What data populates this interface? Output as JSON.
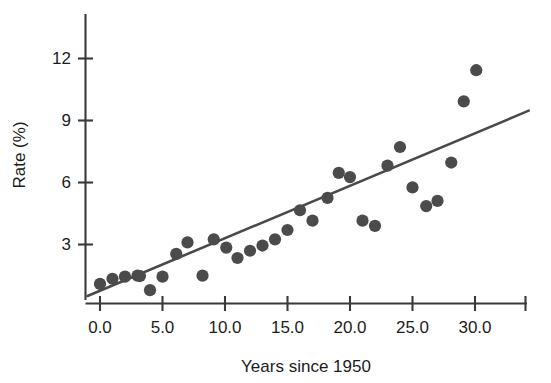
{
  "chart_data": {
    "type": "scatter",
    "title": "",
    "subtitle": "",
    "xlabel": "Years since 1950",
    "ylabel": "Rate (%)",
    "xlim": [
      -1.0,
      34.0
    ],
    "ylim": [
      0.3,
      13.2
    ],
    "xticks": [
      0.0,
      5.0,
      10.0,
      15.0,
      20.0,
      25.0,
      30.0
    ],
    "xtick_labels": [
      "0.0",
      "5.0",
      "10.0",
      "15.0",
      "20.0",
      "25.0",
      "30.0"
    ],
    "yticks": [
      3,
      6,
      9,
      12
    ],
    "ytick_labels": [
      "3",
      "6",
      "9",
      "12"
    ],
    "grid": false,
    "legend": null,
    "marker_color": "#4b4b4b",
    "line_color": "#4a4a4a",
    "axis_color": "#3a3a3a",
    "points": [
      {
        "x": 0.0,
        "y": 1.1
      },
      {
        "x": 1.0,
        "y": 1.35
      },
      {
        "x": 2.0,
        "y": 1.45
      },
      {
        "x": 3.0,
        "y": 1.5
      },
      {
        "x": 3.2,
        "y": 1.48
      },
      {
        "x": 4.0,
        "y": 0.8
      },
      {
        "x": 5.0,
        "y": 1.45
      },
      {
        "x": 6.1,
        "y": 2.55
      },
      {
        "x": 7.0,
        "y": 3.1
      },
      {
        "x": 8.2,
        "y": 1.5
      },
      {
        "x": 9.1,
        "y": 3.25
      },
      {
        "x": 10.1,
        "y": 2.85
      },
      {
        "x": 11.0,
        "y": 2.35
      },
      {
        "x": 12.0,
        "y": 2.7
      },
      {
        "x": 13.0,
        "y": 2.95
      },
      {
        "x": 14.0,
        "y": 3.25
      },
      {
        "x": 15.0,
        "y": 3.7
      },
      {
        "x": 16.0,
        "y": 4.65
      },
      {
        "x": 17.0,
        "y": 4.15
      },
      {
        "x": 18.2,
        "y": 5.25
      },
      {
        "x": 19.1,
        "y": 6.45
      },
      {
        "x": 20.0,
        "y": 6.25
      },
      {
        "x": 21.0,
        "y": 4.15
      },
      {
        "x": 22.0,
        "y": 3.9
      },
      {
        "x": 23.0,
        "y": 6.8
      },
      {
        "x": 24.0,
        "y": 7.7
      },
      {
        "x": 25.0,
        "y": 5.75
      },
      {
        "x": 26.1,
        "y": 4.85
      },
      {
        "x": 27.0,
        "y": 5.1
      },
      {
        "x": 28.1,
        "y": 6.95
      },
      {
        "x": 29.1,
        "y": 9.9
      },
      {
        "x": 30.1,
        "y": 11.4
      }
    ],
    "fit_line": {
      "label": "least-squares regression line",
      "x_start": -1.0,
      "y_start": 0.52,
      "x_end": 34.3,
      "y_end": 9.45
    }
  }
}
